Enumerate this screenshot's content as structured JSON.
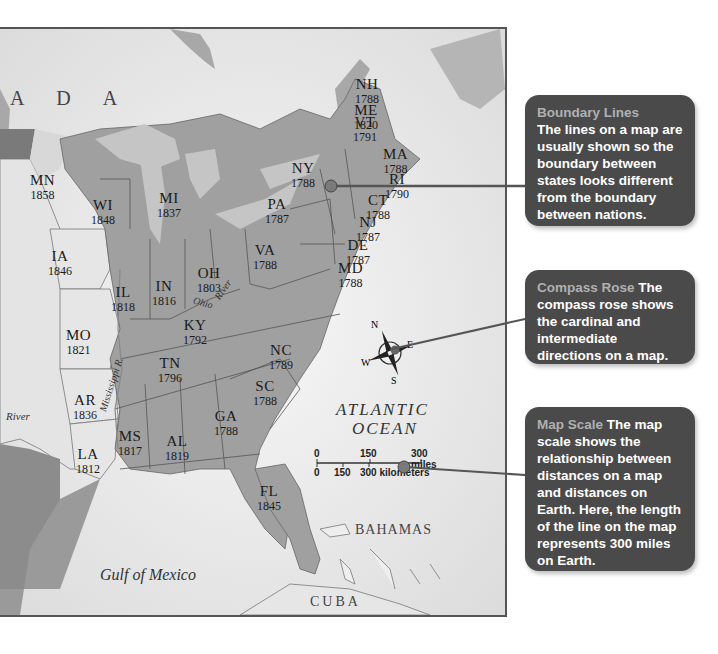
{
  "map": {
    "regions": {
      "canada_partial": "A D A",
      "bahamas": "BAHAMAS",
      "cuba": "CUBA"
    },
    "water": {
      "atlantic_line1": "ATLANTIC",
      "atlantic_line2": "OCEAN",
      "gulf": "Gulf of Mexico",
      "ohio_river_1": "Ohio",
      "ohio_river_2": "River",
      "mississippi": "Mississippi R.",
      "river_west": "River"
    },
    "states": [
      {
        "abbr": "NH",
        "year": "1788"
      },
      {
        "abbr": "VT",
        "year": "1791"
      },
      {
        "abbr": "ME",
        "year": "1820"
      },
      {
        "abbr": "MA",
        "year": "1788"
      },
      {
        "abbr": "RI",
        "year": "1790"
      },
      {
        "abbr": "CT",
        "year": "1788"
      },
      {
        "abbr": "NY",
        "year": "1788"
      },
      {
        "abbr": "NJ",
        "year": "1787"
      },
      {
        "abbr": "PA",
        "year": "1787"
      },
      {
        "abbr": "DE",
        "year": "1787"
      },
      {
        "abbr": "MD",
        "year": "1788"
      },
      {
        "abbr": "VA",
        "year": "1788"
      },
      {
        "abbr": "NC",
        "year": "1789"
      },
      {
        "abbr": "SC",
        "year": "1788"
      },
      {
        "abbr": "GA",
        "year": "1788"
      },
      {
        "abbr": "FL",
        "year": "1845"
      },
      {
        "abbr": "AL",
        "year": "1819"
      },
      {
        "abbr": "MS",
        "year": "1817"
      },
      {
        "abbr": "TN",
        "year": "1796"
      },
      {
        "abbr": "KY",
        "year": "1792"
      },
      {
        "abbr": "OH",
        "year": "1803"
      },
      {
        "abbr": "IN",
        "year": "1816"
      },
      {
        "abbr": "IL",
        "year": "1818"
      },
      {
        "abbr": "MI",
        "year": "1837"
      },
      {
        "abbr": "WI",
        "year": "1848"
      },
      {
        "abbr": "MN",
        "year": "1858"
      },
      {
        "abbr": "IA",
        "year": "1846"
      },
      {
        "abbr": "MO",
        "year": "1821"
      },
      {
        "abbr": "AR",
        "year": "1836"
      },
      {
        "abbr": "LA",
        "year": "1812"
      }
    ],
    "compass": {
      "n": "N",
      "s": "S",
      "e": "E",
      "w": "W"
    },
    "scale": {
      "miles_ticks": [
        "0",
        "150",
        "300 miles"
      ],
      "km_ticks": [
        "0",
        "150",
        "300 kilometers"
      ]
    }
  },
  "callouts": [
    {
      "title": "Boundary Lines",
      "body": "The lines on a map are usually shown so the boundary between states looks different from the boundary between nations."
    },
    {
      "title": "Compass Rose",
      "body": "The compass rose shows the cardinal and intermediate directions on a map."
    },
    {
      "title": "Map Scale",
      "body": "The map scale shows the relationship between distances on a map and distances on Earth. Here, the length of the line on the map represents 300 miles on Earth."
    }
  ],
  "colors": {
    "callout_bg": "#4a4a4a",
    "callout_title": "#b0b0b0",
    "land_original": "#9a9a9a",
    "land_other": "#e2e2e2",
    "water": "#ececec",
    "leader_line": "#555555"
  }
}
